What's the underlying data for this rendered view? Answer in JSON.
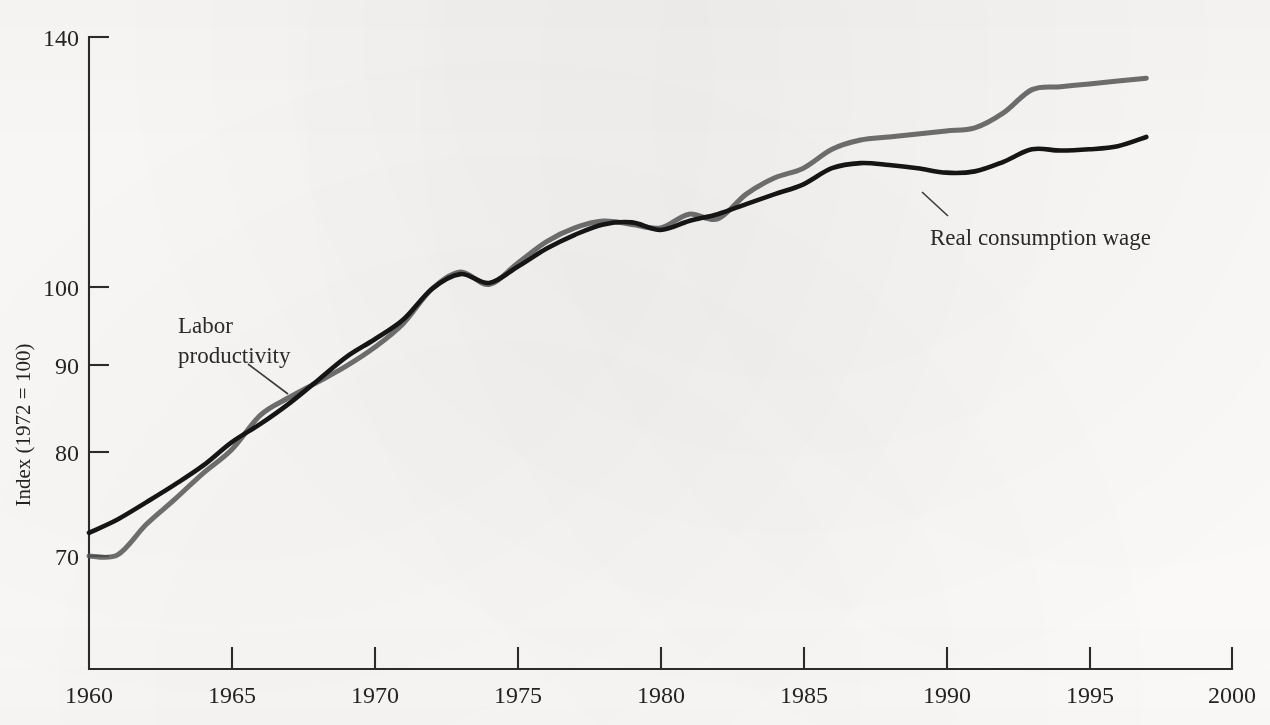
{
  "chart_data": {
    "type": "line",
    "title": "",
    "subtitle": "",
    "xlabel": "",
    "ylabel": "Index (1972 = 100)",
    "xlim": [
      1960,
      2000
    ],
    "ylim": [
      62,
      145
    ],
    "y_scale": "log",
    "grid": false,
    "legend_position": "inline-annotations",
    "x_ticks": [
      1960,
      1965,
      1970,
      1975,
      1980,
      1985,
      1990,
      1995,
      2000
    ],
    "x_tick_labels": [
      "1960",
      "1965",
      "1970",
      "1975",
      "1980",
      "1985",
      "1990",
      "1995",
      "2000"
    ],
    "y_ticks": [
      70,
      80,
      90,
      100,
      140
    ],
    "y_tick_labels": [
      "70",
      "80",
      "90",
      "100",
      "140"
    ],
    "series": [
      {
        "name": "Labor productivity",
        "color": "#555555",
        "annotation": "Labor productivity",
        "x": [
          1960,
          1961,
          1962,
          1963,
          1964,
          1965,
          1966,
          1967,
          1968,
          1969,
          1970,
          1971,
          1972,
          1973,
          1974,
          1975,
          1976,
          1977,
          1978,
          1979,
          1980,
          1981,
          1982,
          1983,
          1984,
          1985,
          1986,
          1987,
          1988,
          1989,
          1990,
          1991,
          1992,
          1993,
          1994,
          1995,
          1996,
          1997
        ],
        "values": [
          70.0,
          70.1,
          73.0,
          75.5,
          78.2,
          80.7,
          84.5,
          86.5,
          88.3,
          90.2,
          92.5,
          95.5,
          100.0,
          102.3,
          100.6,
          103.5,
          106.5,
          108.5,
          109.5,
          109.0,
          108.5,
          110.5,
          109.8,
          113.5,
          116.0,
          117.5,
          120.5,
          122.0,
          122.5,
          123.0,
          123.5,
          124.0,
          126.5,
          130.5,
          131.0,
          131.5,
          132.0,
          132.5
        ]
      },
      {
        "name": "Real consumption wage",
        "color": "#151515",
        "annotation": "Real consumption wage",
        "x": [
          1960,
          1961,
          1962,
          1963,
          1964,
          1965,
          1966,
          1967,
          1968,
          1969,
          1970,
          1971,
          1972,
          1973,
          1974,
          1975,
          1976,
          1977,
          1978,
          1979,
          1980,
          1981,
          1982,
          1983,
          1984,
          1985,
          1986,
          1987,
          1988,
          1989,
          1990,
          1991,
          1992,
          1993,
          1994,
          1995,
          1996,
          1997
        ],
        "values": [
          72.2,
          73.5,
          75.2,
          77.0,
          79.0,
          81.5,
          83.5,
          85.8,
          88.5,
          91.3,
          93.5,
          96.0,
          100.0,
          102.0,
          100.8,
          103.0,
          105.5,
          107.5,
          109.0,
          109.3,
          108.2,
          109.5,
          110.5,
          112.0,
          113.5,
          115.0,
          117.5,
          118.3,
          118.0,
          117.5,
          116.8,
          117.0,
          118.5,
          120.5,
          120.3,
          120.5,
          121.0,
          122.5
        ]
      }
    ],
    "annotations": [
      {
        "text_line_1": "Labor",
        "text_line_2": "productivity",
        "target_series": "Labor productivity",
        "text_x": 178,
        "text_y": 333,
        "leader_from_x": 248,
        "leader_from_y": 364,
        "leader_to_x": 288,
        "leader_to_y": 394
      },
      {
        "text_line_1": "Real consumption wage",
        "text_line_2": "",
        "target_series": "Real consumption wage",
        "text_x": 930,
        "text_y": 238,
        "leader_from_x": 948,
        "leader_from_y": 216,
        "leader_to_x": 922,
        "leader_to_y": 192
      }
    ]
  },
  "axes": {
    "y_title": "Index (1972 = 100)",
    "y_tick_140": "140",
    "y_tick_100": "100",
    "y_tick_90": "90",
    "y_tick_80": "80",
    "y_tick_70": "70",
    "x_tick_1960": "1960",
    "x_tick_1965": "1965",
    "x_tick_1970": "1970",
    "x_tick_1975": "1975",
    "x_tick_1980": "1980",
    "x_tick_1985": "1985",
    "x_tick_1990": "1990",
    "x_tick_1995": "1995",
    "x_tick_2000": "2000"
  },
  "annotations": {
    "labor_productivity_line1": "Labor",
    "labor_productivity_line2": "productivity",
    "real_consumption_wage": "Real consumption wage"
  }
}
